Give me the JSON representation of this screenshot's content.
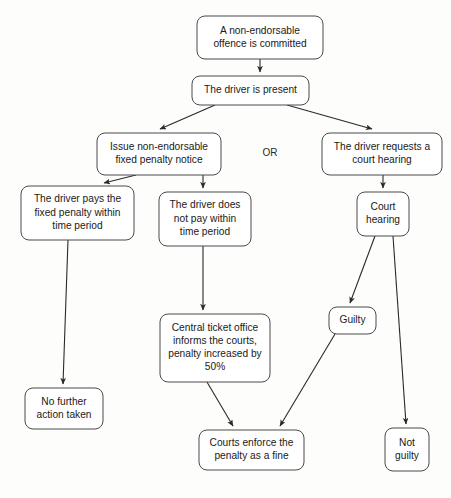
{
  "diagram": {
    "or_label": "OR",
    "colors": {
      "background": "#fdfdfc",
      "box_fill": "#ffffff",
      "box_stroke": "#4a4a4a",
      "connector": "#2a2a2a",
      "text": "#1a1a1a"
    },
    "nodes": [
      {
        "id": "offence",
        "name": "offence-committed-node",
        "lines": [
          "A non-endorsable",
          "offence is committed"
        ],
        "x": 197,
        "y": 16,
        "w": 126,
        "h": 43
      },
      {
        "id": "driver-present",
        "name": "driver-present-node",
        "lines": [
          "The driver is present"
        ],
        "x": 192,
        "y": 76,
        "w": 117,
        "h": 29
      },
      {
        "id": "issue-notice",
        "name": "issue-fixed-penalty-notice-node",
        "lines": [
          "Issue non-endorsable",
          "fixed penalty notice"
        ],
        "x": 97,
        "y": 133,
        "w": 124,
        "h": 42
      },
      {
        "id": "court-request",
        "name": "driver-requests-court-hearing-node",
        "lines": [
          "The driver requests a",
          "court hearing"
        ],
        "x": 322,
        "y": 133,
        "w": 120,
        "h": 42
      },
      {
        "id": "driver-pays",
        "name": "driver-pays-penalty-node",
        "lines": [
          "The driver pays the",
          "fixed penalty within",
          "time period"
        ],
        "x": 21,
        "y": 186,
        "w": 113,
        "h": 54
      },
      {
        "id": "driver-not-pay",
        "name": "driver-does-not-pay-node",
        "lines": [
          "The driver does",
          "not pay within",
          "time period"
        ],
        "x": 159,
        "y": 192,
        "w": 92,
        "h": 54
      },
      {
        "id": "court-hearing",
        "name": "court-hearing-node",
        "lines": [
          "Court",
          "hearing"
        ],
        "x": 357,
        "y": 192,
        "w": 52,
        "h": 44
      },
      {
        "id": "central-ticket",
        "name": "central-ticket-office-node",
        "lines": [
          "Central ticket office",
          "informs the courts,",
          "penalty increased by",
          "50%"
        ],
        "x": 160,
        "y": 314,
        "w": 110,
        "h": 68
      },
      {
        "id": "guilty",
        "name": "guilty-node",
        "lines": [
          "Guilty"
        ],
        "x": 329,
        "y": 307,
        "w": 47,
        "h": 27
      },
      {
        "id": "no-action",
        "name": "no-further-action-node",
        "lines": [
          "No further",
          "action taken"
        ],
        "x": 25,
        "y": 388,
        "w": 78,
        "h": 41
      },
      {
        "id": "courts-enforce",
        "name": "courts-enforce-penalty-node",
        "lines": [
          "Courts enforce the",
          "penalty as a fine"
        ],
        "x": 199,
        "y": 430,
        "w": 105,
        "h": 40
      },
      {
        "id": "not-guilty",
        "name": "not-guilty-node",
        "lines": [
          "Not",
          "guilty"
        ],
        "x": 385,
        "y": 428,
        "w": 44,
        "h": 43
      }
    ],
    "connectors": [
      {
        "name": "connector-offence-to-driver-present",
        "from": "offence",
        "to": "driver-present",
        "path": "M 260,59 L 260,72",
        "arrow": true
      },
      {
        "name": "connector-driver-present-to-issue-notice",
        "from": "driver-present",
        "to": "issue-notice",
        "path": "M 215,105 L 160,129",
        "arrow": true
      },
      {
        "name": "connector-driver-present-to-court-request",
        "from": "driver-present",
        "to": "court-request",
        "path": "M 287,105 L 372,129",
        "arrow": true
      },
      {
        "name": "connector-issue-notice-to-driver-pays",
        "from": "issue-notice",
        "to": "driver-pays",
        "path": "M 136,175 L 104,183",
        "arrow": true
      },
      {
        "name": "connector-issue-notice-to-driver-not-pay",
        "from": "issue-notice",
        "to": "driver-not-pay",
        "path": "M 203,175 L 203,188",
        "arrow": true
      },
      {
        "name": "connector-court-request-to-court-hearing",
        "from": "court-request",
        "to": "court-hearing",
        "path": "M 383,175 L 383,188",
        "arrow": true
      },
      {
        "name": "connector-driver-pays-to-no-action",
        "from": "driver-pays",
        "to": "no-action",
        "path": "M 68,240 L 63,384",
        "arrow": true
      },
      {
        "name": "connector-driver-not-pay-to-central-ticket",
        "from": "driver-not-pay",
        "to": "central-ticket",
        "path": "M 203,246 L 203,310",
        "arrow": true
      },
      {
        "name": "connector-court-hearing-to-guilty",
        "from": "court-hearing",
        "to": "guilty",
        "path": "M 375,236 L 350,303",
        "arrow": true
      },
      {
        "name": "connector-court-hearing-to-not-guilty",
        "from": "court-hearing",
        "to": "not-guilty",
        "path": "M 393,236 L 406,424",
        "arrow": true
      },
      {
        "name": "connector-central-ticket-to-courts-enforce",
        "from": "central-ticket",
        "to": "courts-enforce",
        "path": "M 207,382 L 233,426",
        "arrow": true
      },
      {
        "name": "connector-guilty-to-courts-enforce",
        "from": "guilty",
        "to": "courts-enforce",
        "path": "M 335,334 L 280,426",
        "arrow": true
      }
    ]
  }
}
